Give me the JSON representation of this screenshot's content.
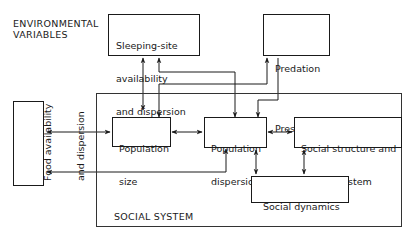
{
  "diagram": {
    "environment_label": [
      "ENVIRONMENTAL",
      "VARIABLES"
    ],
    "system_label": "SOCIAL SYSTEM",
    "nodes": {
      "sleeping_site": {
        "line1": "Sleeping-site",
        "line2": "availability",
        "line3": "and dispersion"
      },
      "predation": {
        "line1": "Predation",
        "line2": "Pressure"
      },
      "food": {
        "line1": "Food availability",
        "line2": "and dispersion"
      },
      "population_size": {
        "line1": "Population",
        "line2": "size"
      },
      "population_dispersion": {
        "line1": "Population",
        "line2": "dispersion"
      },
      "social_structure": {
        "line1": "Social structure and",
        "line2": "mating system"
      },
      "social_dynamics": {
        "line1": "Social dynamics",
        "line2": "in groups"
      }
    },
    "edges": [
      {
        "from": "population_size",
        "to": "sleeping_site",
        "type": "directed"
      },
      {
        "from": "population_dispersion",
        "to": "sleeping_site",
        "type": "directed"
      },
      {
        "from": "sleeping_site",
        "to": "population_dispersion",
        "type": "directed"
      },
      {
        "from": "population_size",
        "to": "predation",
        "type": "directed"
      },
      {
        "from": "predation",
        "to": "population_size",
        "type": "directed"
      },
      {
        "from": "population_dispersion",
        "to": "predation",
        "type": "directed"
      },
      {
        "from": "food",
        "to": "population_size",
        "type": "bidirectional"
      },
      {
        "from": "population_dispersion",
        "to": "food",
        "type": "bidirectional"
      },
      {
        "from": "population_size",
        "to": "population_dispersion",
        "type": "bidirectional"
      },
      {
        "from": "population_dispersion",
        "to": "social_structure",
        "type": "bidirectional"
      },
      {
        "from": "population_dispersion",
        "to": "social_dynamics",
        "type": "bidirectional"
      },
      {
        "from": "social_structure",
        "to": "social_dynamics",
        "type": "bidirectional"
      }
    ]
  }
}
